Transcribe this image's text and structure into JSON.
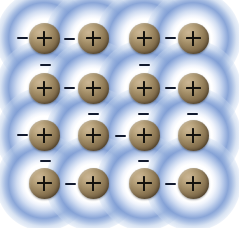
{
  "figure": {
    "width": 239,
    "height": 228,
    "background_color": "#ffffff"
  },
  "colors": {
    "background": "#ffffff",
    "electron_sea_blue": "#809ED4",
    "electron_sea_blue_light": "#CEDBF1",
    "ion_highlight": "#CBB695",
    "ion_midtone": "#A38E68",
    "ion_shadow": "#4F4029",
    "charge_symbol": "#14120D",
    "electron_symbol": "#121A2E"
  },
  "legend": {
    "ion_symbol": "+",
    "electron_symbol": "−",
    "ion_label": "positive metal ion",
    "electron_label": "delocalised electron"
  },
  "lattice": {
    "rows": 4,
    "columns": 4,
    "ion_radius": 15.5,
    "halo_radius": 48,
    "ions": [
      {
        "id": "ion-r1c1",
        "row": 1,
        "col": 1,
        "x": 44,
        "y": 38,
        "charge": "+"
      },
      {
        "id": "ion-r1c2",
        "row": 1,
        "col": 2,
        "x": 93,
        "y": 38,
        "charge": "+"
      },
      {
        "id": "ion-r1c3",
        "row": 1,
        "col": 3,
        "x": 144,
        "y": 38,
        "charge": "+"
      },
      {
        "id": "ion-r1c4",
        "row": 1,
        "col": 4,
        "x": 193,
        "y": 38,
        "charge": "+"
      },
      {
        "id": "ion-r2c1",
        "row": 2,
        "col": 1,
        "x": 44,
        "y": 88,
        "charge": "+"
      },
      {
        "id": "ion-r2c2",
        "row": 2,
        "col": 2,
        "x": 93,
        "y": 88,
        "charge": "+"
      },
      {
        "id": "ion-r2c3",
        "row": 2,
        "col": 3,
        "x": 144,
        "y": 88,
        "charge": "+"
      },
      {
        "id": "ion-r2c4",
        "row": 2,
        "col": 4,
        "x": 193,
        "y": 88,
        "charge": "+"
      },
      {
        "id": "ion-r3c1",
        "row": 3,
        "col": 1,
        "x": 44,
        "y": 135,
        "charge": "+"
      },
      {
        "id": "ion-r3c2",
        "row": 3,
        "col": 2,
        "x": 93,
        "y": 135,
        "charge": "+"
      },
      {
        "id": "ion-r3c3",
        "row": 3,
        "col": 3,
        "x": 144,
        "y": 135,
        "charge": "+"
      },
      {
        "id": "ion-r3c4",
        "row": 3,
        "col": 4,
        "x": 193,
        "y": 135,
        "charge": "+"
      },
      {
        "id": "ion-r4c1",
        "row": 4,
        "col": 1,
        "x": 44,
        "y": 183,
        "charge": "+"
      },
      {
        "id": "ion-r4c2",
        "row": 4,
        "col": 2,
        "x": 93,
        "y": 183,
        "charge": "+"
      },
      {
        "id": "ion-r4c3",
        "row": 4,
        "col": 3,
        "x": 144,
        "y": 183,
        "charge": "+"
      },
      {
        "id": "ion-r4c4",
        "row": 4,
        "col": 4,
        "x": 193,
        "y": 183,
        "charge": "+"
      }
    ],
    "electrons": [
      {
        "id": "electron-01",
        "x": 22,
        "y": 38,
        "charge": "−"
      },
      {
        "id": "electron-02",
        "x": 69,
        "y": 39,
        "charge": "−"
      },
      {
        "id": "electron-03",
        "x": 170,
        "y": 38,
        "charge": "−"
      },
      {
        "id": "electron-04",
        "x": 45,
        "y": 65,
        "charge": "−"
      },
      {
        "id": "electron-05",
        "x": 144,
        "y": 65,
        "charge": "−"
      },
      {
        "id": "electron-06",
        "x": 69,
        "y": 88,
        "charge": "−"
      },
      {
        "id": "electron-07",
        "x": 170,
        "y": 88,
        "charge": "−"
      },
      {
        "id": "electron-08",
        "x": 93,
        "y": 114,
        "charge": "−"
      },
      {
        "id": "electron-09",
        "x": 143,
        "y": 114,
        "charge": "−"
      },
      {
        "id": "electron-10",
        "x": 192,
        "y": 114,
        "charge": "−"
      },
      {
        "id": "electron-11",
        "x": 22,
        "y": 135,
        "charge": "−"
      },
      {
        "id": "electron-12",
        "x": 120,
        "y": 136,
        "charge": "−"
      },
      {
        "id": "electron-13",
        "x": 45,
        "y": 161,
        "charge": "−"
      },
      {
        "id": "electron-14",
        "x": 143,
        "y": 161,
        "charge": "−"
      },
      {
        "id": "electron-15",
        "x": 70,
        "y": 184,
        "charge": "−"
      },
      {
        "id": "electron-16",
        "x": 170,
        "y": 184,
        "charge": "−"
      }
    ]
  }
}
